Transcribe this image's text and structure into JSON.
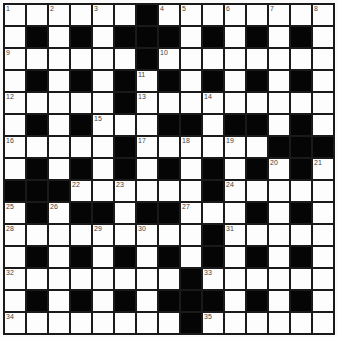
{
  "puzzle": {
    "rows": 15,
    "cols": 15,
    "colors": {
      "black_cell": "#050505",
      "white_cell": "#fdfdfd",
      "grid_line": "#1a1a1a",
      "number_text": "#444444"
    },
    "grid": [
      [
        "1",
        "",
        "2",
        "",
        "3",
        "",
        "#",
        "4",
        "5",
        "",
        "6",
        "",
        "7",
        "",
        "8"
      ],
      [
        "",
        "#",
        "",
        "#",
        "",
        "#",
        "#",
        "#",
        "",
        "#",
        "",
        "#",
        "",
        "#",
        ""
      ],
      [
        "9",
        "",
        "",
        "",
        "",
        "",
        "#",
        "10",
        "",
        "",
        "",
        "",
        "",
        "",
        ""
      ],
      [
        "",
        "#",
        "",
        "#",
        "",
        "#",
        "11",
        "#",
        "",
        "#",
        "",
        "#",
        "",
        "#",
        ""
      ],
      [
        "12",
        "",
        "",
        "",
        "",
        "#",
        "13",
        "",
        "",
        "14",
        "",
        "",
        "",
        "",
        ""
      ],
      [
        "",
        "#",
        "",
        "#",
        "15",
        "",
        "",
        "#",
        "#",
        "",
        "#",
        "#",
        "",
        "#",
        ""
      ],
      [
        "16",
        "",
        "",
        "",
        "",
        "#",
        "17",
        "",
        "18",
        "",
        "19",
        "",
        "#",
        "#",
        "#"
      ],
      [
        "",
        "#",
        "",
        "#",
        "",
        "#",
        "",
        "#",
        "",
        "#",
        "",
        "#",
        "20",
        "#",
        "21"
      ],
      [
        "#",
        "#",
        "#",
        "22",
        "",
        "23",
        "",
        "",
        "",
        "#",
        "24",
        "",
        "",
        "",
        ""
      ],
      [
        "25",
        "#",
        "26",
        "#",
        "#",
        "",
        "#",
        "#",
        "27",
        "",
        "",
        "#",
        "",
        "#",
        ""
      ],
      [
        "28",
        "",
        "",
        "",
        "29",
        "",
        "30",
        "",
        "",
        "#",
        "31",
        "",
        "",
        "",
        ""
      ],
      [
        "",
        "#",
        "",
        "#",
        "",
        "#",
        "",
        "#",
        "",
        "#",
        "",
        "#",
        "",
        "#",
        ""
      ],
      [
        "32",
        "",
        "",
        "",
        "",
        "",
        "",
        "",
        "#",
        "33",
        "",
        "",
        "",
        "",
        ""
      ],
      [
        "",
        "#",
        "",
        "#",
        "",
        "#",
        "",
        "#",
        "#",
        "#",
        "",
        "#",
        "",
        "#",
        ""
      ],
      [
        "34",
        "",
        "",
        "",
        "",
        "",
        "",
        "",
        "#",
        "35",
        "",
        "",
        "",
        "",
        ""
      ]
    ],
    "clue_numbers": [
      "1",
      "2",
      "3",
      "4",
      "5",
      "6",
      "7",
      "8",
      "9",
      "10",
      "11",
      "12",
      "13",
      "14",
      "15",
      "16",
      "17",
      "18",
      "19",
      "20",
      "21",
      "22",
      "23",
      "24",
      "25",
      "26",
      "27",
      "28",
      "29",
      "30",
      "31",
      "32",
      "33",
      "34",
      "35"
    ]
  }
}
